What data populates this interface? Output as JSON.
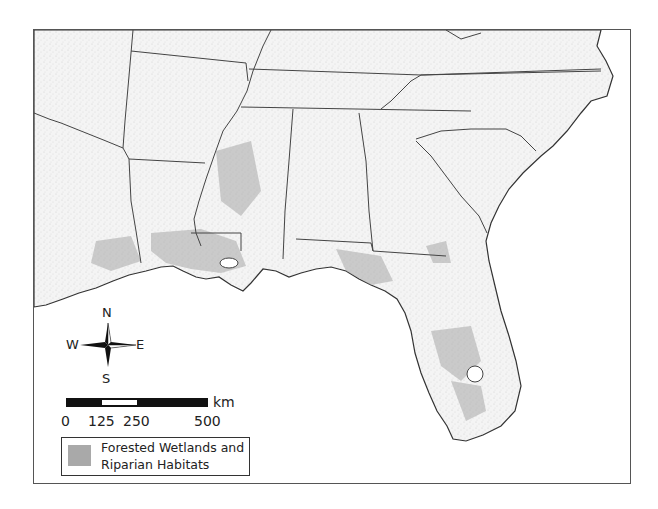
{
  "map": {
    "region": "Southeastern United States",
    "colors": {
      "frame": "#555555",
      "land": "#f6f6f6",
      "water": "#ffffff",
      "borders": "#444444",
      "wetland": "#a9a9a9"
    }
  },
  "compass": {
    "n": "N",
    "s": "S",
    "e": "E",
    "w": "W"
  },
  "scale_bar": {
    "unit": "km",
    "ticks": [
      "0",
      "125",
      "250",
      "500"
    ]
  },
  "legend": {
    "items": [
      {
        "label": "Forested Wetlands and Riparian Habitats",
        "color": "#a9a9a9"
      }
    ]
  }
}
